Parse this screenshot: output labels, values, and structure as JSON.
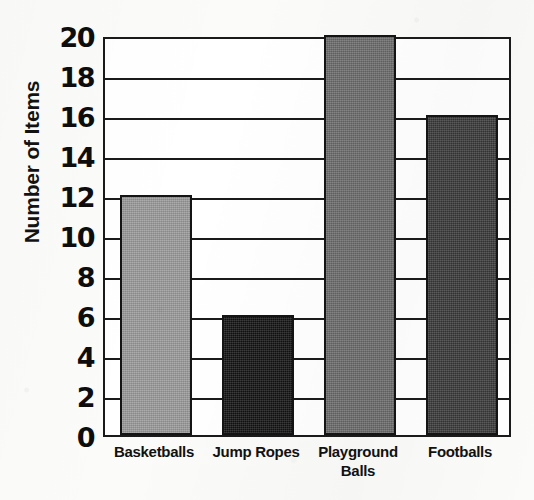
{
  "chart_data": {
    "type": "bar",
    "title": "",
    "xlabel": "",
    "ylabel": "Number of Items",
    "ylim": [
      0,
      20
    ],
    "ytick_step": 2,
    "yticks": [
      20,
      18,
      16,
      14,
      12,
      10,
      8,
      6,
      4,
      2,
      0
    ],
    "grid": true,
    "legend": "none",
    "categories": [
      "Basketballs",
      "Jump Ropes",
      "Playground Balls",
      "Footballs"
    ],
    "category_lines": [
      [
        "Basketballs"
      ],
      [
        "Jump Ropes"
      ],
      [
        "Playground",
        "Balls"
      ],
      [
        "Footballs"
      ]
    ],
    "values": [
      12,
      6,
      20,
      16
    ],
    "bar_colors": [
      "#9a9a9a",
      "#121212",
      "#6b6b6b",
      "#393939"
    ],
    "bars": [
      {
        "category": "Basketballs",
        "value": 12,
        "color": "#9a9a9a"
      },
      {
        "category": "Jump Ropes",
        "value": 6,
        "color": "#121212"
      },
      {
        "category": "Playground Balls",
        "value": 20,
        "color": "#6b6b6b"
      },
      {
        "category": "Footballs",
        "value": 16,
        "color": "#393939"
      }
    ]
  },
  "axis": {
    "y_title": "Number of Items",
    "y_tick_labels": [
      "20",
      "18",
      "16",
      "14",
      "12",
      "10",
      "8",
      "6",
      "4",
      "2",
      "0"
    ]
  },
  "style": {
    "axis_color": "#1a1a1a",
    "text_color": "#111111",
    "plot_background": "#ffffff",
    "page_background": "#fbfbf9"
  }
}
